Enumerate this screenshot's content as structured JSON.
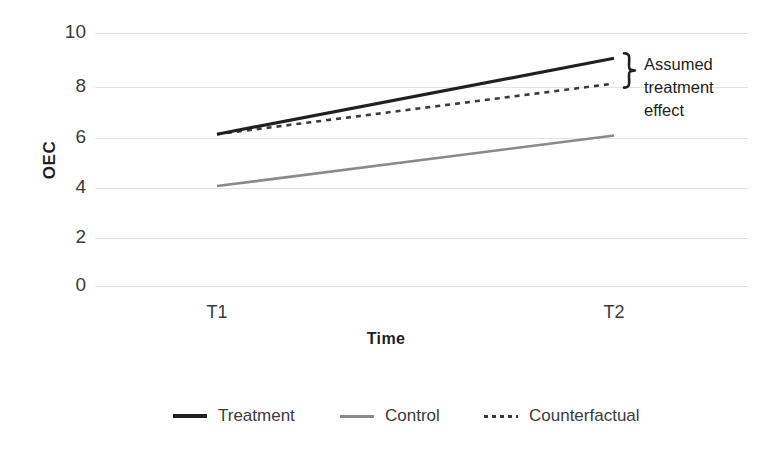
{
  "chart_data": {
    "type": "line",
    "title": "",
    "xlabel": "Time",
    "ylabel": "OEC",
    "x": [
      "T1",
      "T2"
    ],
    "xtick_labels": [
      "T1",
      "T2"
    ],
    "ytick_labels": [
      "0",
      "2",
      "4",
      "6",
      "8",
      "10"
    ],
    "ylim": [
      0,
      10
    ],
    "yticks": [
      0,
      2,
      4,
      6,
      8,
      10
    ],
    "grid": "horizontal",
    "legend_position": "bottom",
    "series": [
      {
        "name": "Treatment",
        "values": [
          6,
          9
        ],
        "style": "solid",
        "color": "#231f20",
        "width": 3.2
      },
      {
        "name": "Control",
        "values": [
          3.95,
          5.95
        ],
        "style": "solid",
        "color": "#8a8a8a",
        "width": 2.6
      },
      {
        "name": "Counterfactual",
        "values": [
          6,
          8
        ],
        "style": "dotted",
        "color": "#3b3b3b",
        "width": 2.6
      }
    ],
    "annotations": [
      {
        "text": "Assumed treatment effect",
        "lines": [
          "Assumed",
          "treatment",
          "effect"
        ],
        "kind": "curly-brace",
        "at_x": "T2",
        "span_y": [
          8,
          9
        ]
      }
    ]
  },
  "colors": {
    "treatment": "#231f20",
    "control": "#8a8a8a",
    "counterfactual": "#3b3b3b",
    "gridline": "#e2e2e2",
    "background": "#ffffff",
    "text": "#3b3b3b"
  },
  "axes": {
    "y_title": "OEC",
    "x_title": "Time",
    "y_ticks": [
      {
        "label": "10",
        "value": 10
      },
      {
        "label": "8",
        "value": 8
      },
      {
        "label": "6",
        "value": 6
      },
      {
        "label": "4",
        "value": 4
      },
      {
        "label": "2",
        "value": 2
      },
      {
        "label": "0",
        "value": 0
      }
    ],
    "x_ticks": [
      {
        "label": "T1",
        "value": 0
      },
      {
        "label": "T2",
        "value": 1
      }
    ]
  },
  "legend": {
    "items": [
      {
        "label": "Treatment",
        "marker": "solid-thick-black"
      },
      {
        "label": "Control",
        "marker": "solid-gray"
      },
      {
        "label": "Counterfactual",
        "marker": "dotted-black"
      }
    ]
  },
  "annotation": {
    "line1": "Assumed",
    "line2": "treatment",
    "line3": "effect"
  }
}
